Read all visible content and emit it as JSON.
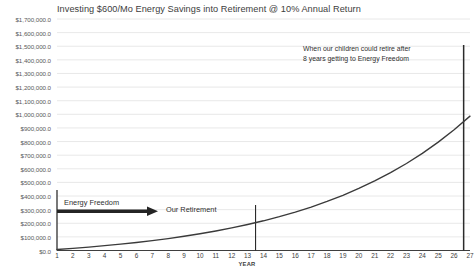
{
  "chart_data": {
    "type": "line",
    "title": "Investing $600/Mo Energy Savings into Retirement  @ 10% Annual Return",
    "xlabel": "YEAR",
    "ylabel": "",
    "grid": true,
    "legend": "none",
    "xlim": [
      1,
      27
    ],
    "ylim": [
      0,
      1700000
    ],
    "x": [
      1,
      2,
      3,
      4,
      5,
      6,
      7,
      8,
      9,
      10,
      11,
      12,
      13,
      14,
      15,
      16,
      17,
      18,
      19,
      20,
      21,
      22,
      23,
      24,
      25,
      26,
      27
    ],
    "xtick_labels": [
      "1",
      "2",
      "3",
      "4",
      "5",
      "6",
      "7",
      "8",
      "9",
      "10",
      "11",
      "12",
      "13",
      "14",
      "15",
      "16",
      "17",
      "18",
      "19",
      "20",
      "21",
      "22",
      "23",
      "24",
      "25",
      "26",
      "27"
    ],
    "ytick_labels": [
      "$1,700,000.0",
      "$1,600,000.0",
      "$1,500,000.0",
      "$1,400,000.0",
      "$1,300,000.0",
      "$1,200,000.0",
      "$1,100,000.0",
      "$1,000,000.0",
      "$900,000.0",
      "$800,000.0",
      "$700,000.0",
      "$600,000.0",
      "$500,000.0",
      "$400,000.0",
      "$300,000.0",
      "$200,000.0",
      "$100,000.0",
      "$0.0"
    ],
    "ytick_values": [
      1700000,
      1600000,
      1500000,
      1400000,
      1300000,
      1200000,
      1100000,
      1000000,
      900000,
      800000,
      700000,
      600000,
      500000,
      400000,
      300000,
      200000,
      100000,
      0
    ],
    "series": [
      {
        "name": "Portfolio Value",
        "color": "#3a3a3a",
        "values": [
          7540,
          15870,
          25070,
          35230,
          46460,
          58860,
          72560,
          87690,
          104410,
          122880,
          143280,
          165820,
          190720,
          218230,
          248620,
          282190,
          319280,
          360250,
          405500,
          455500,
          510730,
          571730,
          639100,
          713510,
          795700,
          886490,
          986800
        ]
      }
    ],
    "annotations": [
      {
        "name": "children-retire-note",
        "line1": "When our children could retire after",
        "line2": "8 years getting to Energy Freedom"
      },
      {
        "name": "energy-freedom-label",
        "text": "Energy Freedom"
      },
      {
        "name": "our-retirement-label",
        "text": "Our Retirement"
      }
    ],
    "markers": [
      {
        "name": "our-retirement-marker",
        "x": 13.5,
        "type": "vertical-line"
      },
      {
        "name": "children-retirement-marker",
        "x": 26.6,
        "type": "vertical-line"
      },
      {
        "name": "energy-freedom-arrow",
        "from_x": 1,
        "to_x": 8.1,
        "type": "arrow"
      }
    ],
    "colors": {
      "curve": "#3a3a3a",
      "grid": "#e2e2e2",
      "axis": "#404040",
      "text": "#3d3d3d",
      "background": "#ffffff"
    }
  }
}
